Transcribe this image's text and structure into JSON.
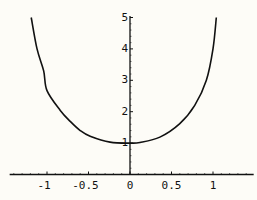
{
  "chart_data": {
    "type": "line",
    "title": "",
    "xlabel": "",
    "ylabel": "",
    "xlim": [
      -1.45,
      1.49
    ],
    "ylim": [
      0,
      5.05
    ],
    "grid": false,
    "legend": null,
    "x_ticks": [
      -1,
      -0.5,
      0,
      0.5,
      1
    ],
    "x_tick_labels": [
      "-1",
      "-0.5",
      "0",
      "0.5",
      "1"
    ],
    "y_ticks": [
      1,
      2,
      3,
      4,
      5
    ],
    "y_tick_labels": [
      "1",
      "2",
      "3",
      "4",
      "5"
    ],
    "series": [
      {
        "name": "curve",
        "color": "#111111",
        "x": [
          -1.19,
          -1.12,
          -1.04,
          -1.0,
          -0.84,
          -0.72,
          -0.6,
          -0.48,
          -0.24,
          0.0,
          0.12,
          0.36,
          0.6,
          0.78,
          0.92,
          1.0,
          1.04
        ],
        "y": [
          5.0,
          4.0,
          3.3,
          2.67,
          2.04,
          1.69,
          1.4,
          1.22,
          1.03,
          1.0,
          1.02,
          1.19,
          1.62,
          2.2,
          3.0,
          4.0,
          5.0
        ]
      }
    ]
  },
  "colors": {
    "background": "#fdfcf7",
    "axis": "#111111",
    "curve": "#111111"
  }
}
